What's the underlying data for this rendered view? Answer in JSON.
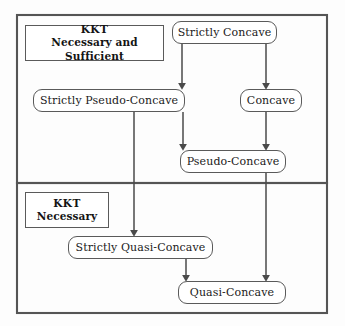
{
  "diagram": {
    "background_color": "#fdfdfd",
    "line_color": "#555555",
    "text_color": "#1a1a1a",
    "frame": {
      "x": 17,
      "y": 15,
      "width": 310,
      "height": 298
    },
    "divider_y": 183,
    "panels": [
      {
        "id": "kkt-necessary-and-sufficient",
        "label_line1": "KKT",
        "label_line2": "Necessary and Sufficient",
        "label_box": {
          "x": 25,
          "y": 25,
          "width": 139,
          "height": 36
        }
      },
      {
        "id": "kkt-necessary",
        "label_line1": "KKT",
        "label_line2": "Necessary",
        "label_box": {
          "x": 25,
          "y": 192,
          "width": 84,
          "height": 36
        }
      }
    ],
    "nodes": [
      {
        "id": "strictly-concave",
        "label": "Strictly Concave",
        "x": 172,
        "y": 21,
        "width": 105,
        "height": 23,
        "font_size": 11
      },
      {
        "id": "strictly-pseudo-concave",
        "label": "Strictly Pseudo-Concave",
        "x": 33,
        "y": 89,
        "width": 152,
        "height": 23,
        "font_size": 11
      },
      {
        "id": "concave",
        "label": "Concave",
        "x": 240,
        "y": 89,
        "width": 62,
        "height": 23,
        "font_size": 11
      },
      {
        "id": "pseudo-concave",
        "label": "Pseudo-Concave",
        "x": 180,
        "y": 150,
        "width": 106,
        "height": 23,
        "font_size": 11
      },
      {
        "id": "strictly-quasi-concave",
        "label": "Strictly Quasi-Concave",
        "x": 68,
        "y": 236,
        "width": 145,
        "height": 23,
        "font_size": 11
      },
      {
        "id": "quasi-concave",
        "label": "Quasi-Concave",
        "x": 178,
        "y": 281,
        "width": 108,
        "height": 23,
        "font_size": 11
      }
    ],
    "edges": [
      {
        "id": "strictly-concave-to-strictly-pseudo-concave",
        "from": "strictly-concave",
        "to": "strictly-pseudo-concave",
        "path": "M 182,44 L 182,87"
      },
      {
        "id": "strictly-concave-to-concave",
        "from": "strictly-concave",
        "to": "concave",
        "path": "M 266,44 L 266,87"
      },
      {
        "id": "strictly-pseudo-concave-to-pseudo-concave",
        "from": "strictly-pseudo-concave",
        "to": "pseudo-concave",
        "path": "M 183,112 L 183,148"
      },
      {
        "id": "concave-to-pseudo-concave",
        "from": "concave",
        "to": "pseudo-concave",
        "path": "M 266,112 L 266,148"
      },
      {
        "id": "strictly-pseudo-concave-to-strictly-quasi-concave",
        "from": "strictly-pseudo-concave",
        "to": "strictly-quasi-concave",
        "path": "M 134,112 L 134,234"
      },
      {
        "id": "strictly-quasi-concave-to-quasi-concave",
        "from": "strictly-quasi-concave",
        "to": "quasi-concave",
        "path": "M 186,259 L 186,279"
      },
      {
        "id": "pseudo-concave-to-quasi-concave",
        "from": "pseudo-concave",
        "to": "quasi-concave",
        "path": "M 266,173 L 266,279"
      }
    ]
  }
}
